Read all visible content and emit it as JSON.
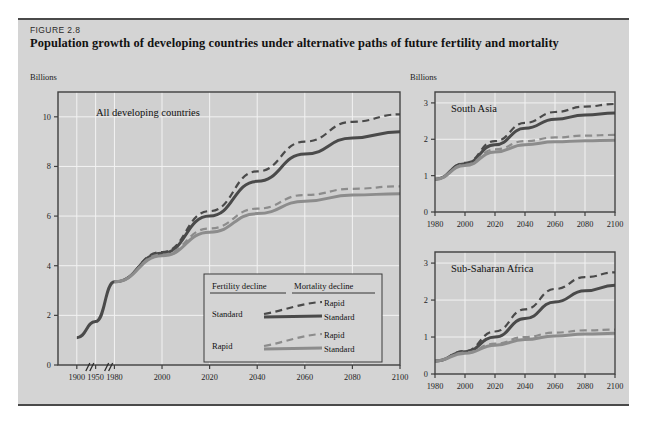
{
  "figure": {
    "label": "FIGURE 2.8",
    "title": "Population growth of developing countries under alternative paths of future fertility and mortality"
  },
  "colors": {
    "card_bg": "#d4d4d4",
    "plot_bg": "#d0d0d0",
    "grid": "#f2f2f2",
    "frame": "#3f3f3f",
    "series_standard_fertility": "#4a4a4a",
    "series_rapid_fertility": "#8c8c8c",
    "text": "#111111"
  },
  "legend": {
    "col1_header": "Fertility decline",
    "col2_header": "Mortality decline",
    "rows": [
      {
        "fertility": "Standard",
        "mortality_dashed": "Rapid",
        "mortality_solid": "Standard",
        "color": "#4a4a4a"
      },
      {
        "fertility": "Rapid",
        "mortality_dashed": "Rapid",
        "mortality_solid": "Standard",
        "color": "#8c8c8c"
      }
    ]
  },
  "chart_data": [
    {
      "type": "line",
      "name": "All developing countries",
      "title": "All developing countries",
      "ylabel": "Billions",
      "xlabel": "",
      "grid": true,
      "axis_break_after": [
        1900,
        1950
      ],
      "xticks": [
        1900,
        1950,
        1980,
        2000,
        2020,
        2040,
        2060,
        2080,
        2100
      ],
      "yticks": [
        0,
        2,
        4,
        6,
        8,
        10
      ],
      "ylim": [
        0,
        11
      ],
      "series": [
        {
          "name": "Historical",
          "style": "solid",
          "color": "#4a4a4a",
          "x": [
            1900,
            1950,
            1980
          ],
          "values": [
            1.1,
            1.75,
            3.35
          ]
        },
        {
          "name": "Standard fertility, rapid mortality",
          "style": "dashed",
          "color": "#4a4a4a",
          "x": [
            1980,
            2000,
            2020,
            2040,
            2060,
            2080,
            2100
          ],
          "values": [
            3.35,
            4.55,
            6.2,
            7.8,
            9.0,
            9.8,
            10.1
          ]
        },
        {
          "name": "Standard fertility, standard mortality",
          "style": "solid",
          "color": "#4a4a4a",
          "x": [
            1980,
            2000,
            2020,
            2040,
            2060,
            2080,
            2100
          ],
          "values": [
            3.35,
            4.5,
            6.0,
            7.4,
            8.5,
            9.15,
            9.4
          ]
        },
        {
          "name": "Rapid fertility, rapid mortality",
          "style": "dashed",
          "color": "#8c8c8c",
          "x": [
            1980,
            2000,
            2020,
            2040,
            2060,
            2080,
            2100
          ],
          "values": [
            3.35,
            4.45,
            5.5,
            6.3,
            6.85,
            7.1,
            7.2
          ]
        },
        {
          "name": "Rapid fertility, standard mortality",
          "style": "solid",
          "color": "#8c8c8c",
          "x": [
            1980,
            2000,
            2020,
            2040,
            2060,
            2080,
            2100
          ],
          "values": [
            3.35,
            4.4,
            5.35,
            6.1,
            6.6,
            6.85,
            6.9
          ]
        }
      ]
    },
    {
      "type": "line",
      "name": "South Asia",
      "title": "South Asia",
      "ylabel": "Billions",
      "xlabel": "",
      "grid": true,
      "xticks": [
        1980,
        2000,
        2020,
        2040,
        2060,
        2080,
        2100
      ],
      "yticks": [
        0,
        1,
        2,
        3
      ],
      "ylim": [
        0,
        3.3
      ],
      "series": [
        {
          "name": "Standard fertility, rapid mortality",
          "style": "dashed",
          "color": "#4a4a4a",
          "x": [
            1980,
            2000,
            2020,
            2040,
            2060,
            2080,
            2100
          ],
          "values": [
            0.9,
            1.35,
            1.95,
            2.45,
            2.75,
            2.9,
            2.97
          ]
        },
        {
          "name": "Standard fertility, standard mortality",
          "style": "solid",
          "color": "#4a4a4a",
          "x": [
            1980,
            2000,
            2020,
            2040,
            2060,
            2080,
            2100
          ],
          "values": [
            0.9,
            1.33,
            1.85,
            2.3,
            2.55,
            2.67,
            2.72
          ]
        },
        {
          "name": "Rapid fertility, rapid mortality",
          "style": "dashed",
          "color": "#8c8c8c",
          "x": [
            1980,
            2000,
            2020,
            2040,
            2060,
            2080,
            2100
          ],
          "values": [
            0.9,
            1.3,
            1.72,
            1.95,
            2.05,
            2.1,
            2.12
          ]
        },
        {
          "name": "Rapid fertility, standard mortality",
          "style": "solid",
          "color": "#8c8c8c",
          "x": [
            1980,
            2000,
            2020,
            2040,
            2060,
            2080,
            2100
          ],
          "values": [
            0.9,
            1.28,
            1.65,
            1.85,
            1.93,
            1.96,
            1.97
          ]
        }
      ]
    },
    {
      "type": "line",
      "name": "Sub-Saharan Africa",
      "title": "Sub-Saharan Africa",
      "ylabel": "",
      "xlabel": "",
      "grid": true,
      "xticks": [
        1980,
        2000,
        2020,
        2040,
        2060,
        2080,
        2100
      ],
      "yticks": [
        0,
        1,
        2,
        3
      ],
      "ylim": [
        0,
        3.3
      ],
      "series": [
        {
          "name": "Standard fertility, rapid mortality",
          "style": "dashed",
          "color": "#4a4a4a",
          "x": [
            1980,
            2000,
            2020,
            2040,
            2060,
            2080,
            2100
          ],
          "values": [
            0.35,
            0.62,
            1.15,
            1.75,
            2.3,
            2.62,
            2.75
          ]
        },
        {
          "name": "Standard fertility, standard mortality",
          "style": "solid",
          "color": "#4a4a4a",
          "x": [
            1980,
            2000,
            2020,
            2040,
            2060,
            2080,
            2100
          ],
          "values": [
            0.35,
            0.6,
            1.0,
            1.5,
            1.95,
            2.25,
            2.4
          ]
        },
        {
          "name": "Rapid fertility, rapid mortality",
          "style": "dashed",
          "color": "#8c8c8c",
          "x": [
            1980,
            2000,
            2020,
            2040,
            2060,
            2080,
            2100
          ],
          "values": [
            0.35,
            0.58,
            0.82,
            1.0,
            1.12,
            1.18,
            1.2
          ]
        },
        {
          "name": "Rapid fertility, standard mortality",
          "style": "solid",
          "color": "#8c8c8c",
          "x": [
            1980,
            2000,
            2020,
            2040,
            2060,
            2080,
            2100
          ],
          "values": [
            0.35,
            0.56,
            0.78,
            0.93,
            1.03,
            1.08,
            1.1
          ]
        }
      ]
    }
  ]
}
